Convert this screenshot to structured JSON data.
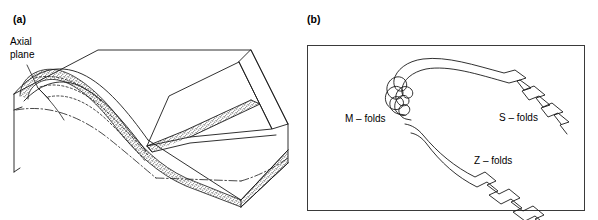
{
  "figure": {
    "background_color": "#ffffff",
    "line_color": "#1a1a1a",
    "stipple_color": "#6b6b6b",
    "panels": [
      {
        "id": "a",
        "label": "(a)",
        "type": "block-diagram",
        "caption_annotations": [
          {
            "name": "axial-plane",
            "text": "Axial\nplane"
          }
        ],
        "description_elements": [
          "three-dimensional block diagram",
          "antiformal fold with hinge exposed on left face",
          "stippled marker bed following the fold",
          "dashed hidden fold traces on top surface",
          "dash-dot axial trace lines",
          "raised ridge layer along upper right edge"
        ]
      },
      {
        "id": "b",
        "label": "(b)",
        "type": "fold-profile",
        "border_box": {
          "x": 8,
          "y": 45,
          "width": 278,
          "height": 166
        },
        "fold_labels": [
          {
            "name": "m-folds",
            "text": "M – folds",
            "x": 46,
            "y": 122
          },
          {
            "name": "s-folds",
            "text": "S – folds",
            "x": 200,
            "y": 121
          },
          {
            "name": "z-folds",
            "text": "Z – folds",
            "x": 175,
            "y": 164
          }
        ],
        "description_elements": [
          "major antiform profile closing to the left",
          "parasitic M-folds at the hinge zone",
          "asymmetric S-folds on the upper limb",
          "asymmetric Z-folds on the lower limb"
        ]
      }
    ]
  }
}
